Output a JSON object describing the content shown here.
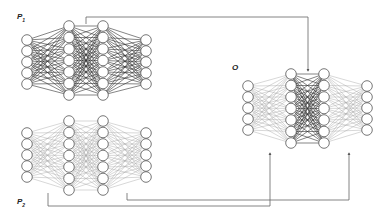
{
  "labels": {
    "p1": {
      "main": "P",
      "sub": "1",
      "x": 17,
      "y": 12
    },
    "p2": {
      "main": "P",
      "sub": "2",
      "x": 17,
      "y": 197
    },
    "o": {
      "main": "O",
      "sub": "",
      "x": 232,
      "y": 63
    }
  },
  "style": {
    "node_radius": 5.3,
    "node_stroke": "#555555",
    "node_fill": "#ffffff",
    "dark_edge": "#333333",
    "light_edge": "#a8a8a8",
    "connector": "#666666"
  },
  "networks": [
    {
      "id": "P1",
      "layers": [
        {
          "x": 27,
          "ys": [
            40,
            51,
            62,
            73,
            84
          ]
        },
        {
          "x": 69,
          "ys": [
            26,
            37.5,
            49,
            60.5,
            72,
            83.5,
            95
          ]
        },
        {
          "x": 103,
          "ys": [
            26,
            37.5,
            49,
            60.5,
            72,
            83.5,
            95
          ]
        },
        {
          "x": 146,
          "ys": [
            40,
            51,
            62,
            73,
            84
          ]
        }
      ],
      "edge_tones": [
        "dark",
        "dark",
        "dark"
      ]
    },
    {
      "id": "P2",
      "layers": [
        {
          "x": 27,
          "ys": [
            133,
            144,
            155,
            166,
            177
          ]
        },
        {
          "x": 69,
          "ys": [
            121,
            132.5,
            144,
            155.5,
            167,
            178.5,
            190
          ]
        },
        {
          "x": 103,
          "ys": [
            121,
            132.5,
            144,
            155.5,
            167,
            178.5,
            190
          ]
        },
        {
          "x": 146,
          "ys": [
            133,
            144,
            155,
            166,
            177
          ]
        }
      ],
      "edge_tones": [
        "light",
        "light",
        "light"
      ]
    },
    {
      "id": "O",
      "layers": [
        {
          "x": 248,
          "ys": [
            86,
            97,
            108,
            119,
            130
          ]
        },
        {
          "x": 291,
          "ys": [
            74,
            85.5,
            97,
            108.5,
            120,
            131.5,
            143
          ]
        },
        {
          "x": 324,
          "ys": [
            74,
            85.5,
            97,
            108.5,
            120,
            131.5,
            143
          ]
        },
        {
          "x": 367,
          "ys": [
            86,
            97,
            108,
            119,
            130
          ]
        }
      ],
      "edge_tones": [
        "light",
        "dark",
        "light"
      ]
    }
  ],
  "connectors": [
    {
      "id": "p1-middle-to-o-middle",
      "points": [
        [
          86,
          24
        ],
        [
          86,
          17
        ],
        [
          308,
          17
        ],
        [
          308,
          71
        ]
      ]
    },
    {
      "id": "p2-first-to-o-first",
      "points": [
        [
          48,
          193
        ],
        [
          48,
          206
        ],
        [
          270,
          206
        ],
        [
          270,
          153
        ]
      ]
    },
    {
      "id": "p2-last-to-o-last",
      "points": [
        [
          127,
          193
        ],
        [
          127,
          200
        ],
        [
          349,
          200
        ],
        [
          349,
          153
        ]
      ]
    }
  ]
}
